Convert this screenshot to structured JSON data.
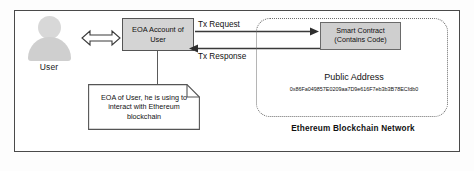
{
  "diagram": {
    "user": {
      "label": "User",
      "icon": "user-avatar-icon"
    },
    "eoa_box": {
      "line1": "EOA Account of",
      "line2": "User"
    },
    "note": {
      "text": "EOA of User, he is using to interact with Ethereum blockchain"
    },
    "arrows": {
      "user_eoa_bidirectional": "double-headed-arrow",
      "tx_request_label": "Tx Request",
      "tx_response_label": "Tx Response"
    },
    "blockchain": {
      "caption": "Ethereum Blockchain Network",
      "smart_contract": {
        "line1": "Smart Contract",
        "line2": "(Contains Code)"
      },
      "public_address_title": "Public Address",
      "public_address_value": "0x86Fa049857E0209aa7D9e616F7eb3b3B78ECfdb0"
    },
    "colors": {
      "frame": "#4a4a4a",
      "box_fill": "#d4d4d4",
      "contract_fill": "#cfcfcf",
      "dashed_border": "#6d6d6d",
      "text": "#111111"
    }
  }
}
